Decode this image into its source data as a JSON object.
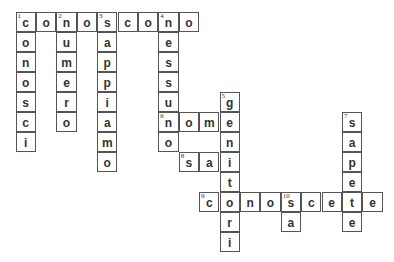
{
  "puzzle": {
    "origin": {
      "x": 16,
      "y": 12
    },
    "cell_width": 20.4,
    "cell_height": 20,
    "entries": [
      {
        "number": "1",
        "direction": "across",
        "row": 0,
        "col": 0,
        "word": "conoscono"
      },
      {
        "number": "1",
        "direction": "down",
        "row": 0,
        "col": 0,
        "word": "conosci"
      },
      {
        "number": "2",
        "direction": "down",
        "row": 0,
        "col": 2,
        "word": "numero"
      },
      {
        "number": "3",
        "direction": "down",
        "row": 0,
        "col": 4,
        "word": "sappiamo"
      },
      {
        "number": "4",
        "direction": "down",
        "row": 0,
        "col": 7,
        "word": "nessuno"
      },
      {
        "number": "5",
        "direction": "down",
        "row": 4,
        "col": 10,
        "word": "genitori"
      },
      {
        "number": "6",
        "direction": "across",
        "row": 5,
        "col": 7,
        "word": "nome"
      },
      {
        "number": "7",
        "direction": "down",
        "row": 5,
        "col": 16,
        "word": "sapete"
      },
      {
        "number": "8",
        "direction": "across",
        "row": 7,
        "col": 8,
        "word": "sai"
      },
      {
        "number": "9",
        "direction": "across",
        "row": 9,
        "col": 9,
        "word": "conoscete"
      },
      {
        "number": "10",
        "direction": "down",
        "row": 9,
        "col": 13,
        "word": "sa"
      }
    ]
  }
}
